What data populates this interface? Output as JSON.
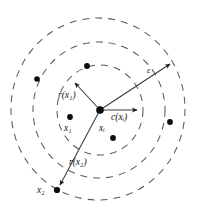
{
  "figure": {
    "type": "concentric-neighborhood-diagram",
    "caption": "",
    "background_color": "#ffffff",
    "stroke_color": "#5a5a5a",
    "point_color": "#0b0b0b",
    "canvas": {
      "width": 203,
      "height": 208
    }
  },
  "labels": {
    "r_x1": {
      "base": "r",
      "open": "(",
      "arg": "x",
      "sub": "1",
      "close": ")",
      "text": "r(x₁)"
    },
    "r_x2": {
      "base": "r",
      "open": "(",
      "arg": "x",
      "sub": "2",
      "close": ")",
      "text": "r(x₂)"
    },
    "epsilon": {
      "text": "ε"
    },
    "c_xi": {
      "base": "c",
      "open": "(",
      "arg": "x",
      "sub": "i",
      "close": ")",
      "text": "c(xᵢ)"
    },
    "x_i": {
      "base": "x",
      "sub": "i",
      "text": "xᵢ"
    },
    "x_1": {
      "base": "x",
      "sub": "1",
      "text": "x₁"
    },
    "x_2": {
      "base": "x",
      "sub": "2",
      "text": "x₂"
    }
  },
  "circles": [
    {
      "name": "inner-circle",
      "cx": 100,
      "cy": 110,
      "rx": 43,
      "ry": 45,
      "style": "dashed"
    },
    {
      "name": "middle-circle",
      "cx": 99,
      "cy": 110,
      "rx": 66,
      "ry": 68,
      "style": "dashed"
    },
    {
      "name": "outer-circle",
      "cx": 98,
      "cy": 109,
      "rx": 87,
      "ry": 91,
      "style": "dashed"
    }
  ],
  "center_point": {
    "name": "x_i",
    "x": 100,
    "y": 110,
    "r": 3.2
  },
  "data_points": [
    {
      "name": "point-upper-left",
      "x": 37,
      "y": 79,
      "r": 2.8,
      "label": ""
    },
    {
      "name": "point-x1-target",
      "x": 87,
      "y": 66,
      "r": 2.9,
      "label": ""
    },
    {
      "name": "point-x1",
      "x": 70,
      "y": 117,
      "r": 2.9,
      "label": "x₁"
    },
    {
      "name": "point-inner-lower",
      "x": 113,
      "y": 138,
      "r": 2.9,
      "label": ""
    },
    {
      "name": "point-right-outer",
      "x": 170,
      "y": 122,
      "r": 2.9,
      "label": ""
    },
    {
      "name": "point-x2",
      "x": 57,
      "y": 190,
      "r": 3.1,
      "label": "x₂"
    }
  ],
  "arrows": [
    {
      "name": "arrow-r-x1",
      "label": "r(x₁)",
      "x1": 100,
      "y1": 110,
      "x2": 73,
      "y2": 81
    },
    {
      "name": "arrow-r-x2",
      "label": "r(x₂)",
      "x1": 100,
      "y1": 110,
      "x2": 58,
      "y2": 188
    },
    {
      "name": "arrow-epsilon",
      "label": "ε",
      "x1": 100,
      "y1": 110,
      "x2": 173,
      "y2": 61
    },
    {
      "name": "arrow-c-xi",
      "label": "c(xᵢ)",
      "x1": 100,
      "y1": 110,
      "x2": 141,
      "y2": 110
    }
  ]
}
